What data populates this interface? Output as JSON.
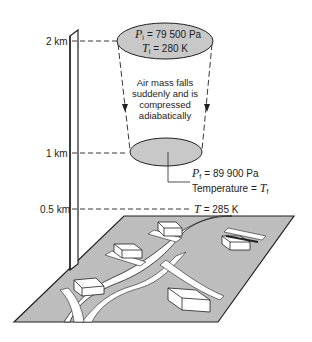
{
  "diagram": {
    "altitude_axis": {
      "labels": [
        {
          "text": "2 km",
          "y": 41
        },
        {
          "text": "1 km",
          "y": 153
        },
        {
          "text": "0.5 km",
          "y": 209
        }
      ]
    },
    "initial_state": {
      "pressure_symbol": "P",
      "pressure_sub": "i",
      "pressure_value": "= 79 500 Pa",
      "temperature_symbol": "T",
      "temperature_sub": "i",
      "temperature_value": "= 280 K"
    },
    "process_caption": {
      "line1": "Air mass falls",
      "line2": "suddenly and is",
      "line3": "compressed",
      "line4": "adiabatically"
    },
    "final_state": {
      "pressure_symbol": "P",
      "pressure_sub": "f",
      "pressure_value": "= 89 900 Pa",
      "temperature_label": "Temperature =",
      "temperature_symbol": "T",
      "temperature_sub": "f"
    },
    "ground_state": {
      "temperature_symbol": "T",
      "temperature_value": "= 285 K"
    },
    "colors": {
      "ellipse_fill": "#c8c8c8",
      "ground_fill": "#bdbdbd",
      "line": "#222222",
      "road": "#ffffff"
    }
  }
}
